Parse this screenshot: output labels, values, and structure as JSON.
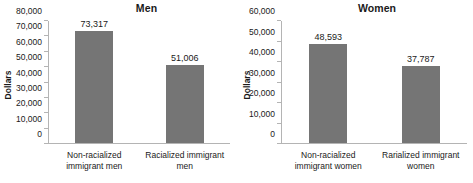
{
  "chart_data": [
    {
      "type": "bar",
      "title": "Men",
      "xlabel": "",
      "ylabel": "Dollars",
      "categories": [
        "Non-racialized immigrant men",
        "Racialized immigrant men"
      ],
      "values": [
        73317,
        51006
      ],
      "value_labels": [
        "73,317",
        "51,006"
      ],
      "ylim": [
        0,
        80000
      ],
      "yticks": [
        0,
        10000,
        20000,
        30000,
        40000,
        50000,
        60000,
        70000,
        80000
      ],
      "ytick_labels": [
        "0",
        "10,000",
        "20,000",
        "30,000",
        "40,000",
        "50,000",
        "60,000",
        "70,000",
        "80,000"
      ],
      "grid": false,
      "legend": false,
      "bar_color": "#757575",
      "axis_color": "#b4b4b4"
    },
    {
      "type": "bar",
      "title": "Women",
      "xlabel": "",
      "ylabel": "Dollars",
      "categories": [
        "Non-racialized immigrant women",
        "Rarialized immigrant women"
      ],
      "values": [
        48593,
        37787
      ],
      "value_labels": [
        "48,593",
        "37,787"
      ],
      "ylim": [
        0,
        60000
      ],
      "yticks": [
        0,
        10000,
        20000,
        30000,
        40000,
        50000,
        60000
      ],
      "ytick_labels": [
        "0",
        "10,000",
        "20,000",
        "30,000",
        "40,000",
        "50,000",
        "60,000"
      ],
      "grid": false,
      "legend": false,
      "bar_color": "#757575",
      "axis_color": "#b4b4b4"
    }
  ]
}
